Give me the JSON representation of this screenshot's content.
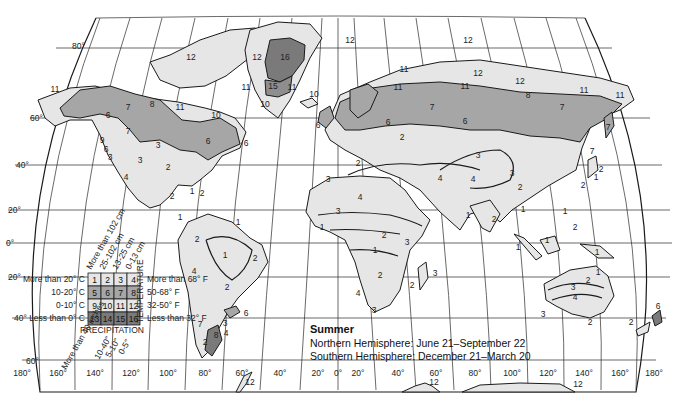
{
  "map": {
    "caption": {
      "title": "Summer",
      "lines": [
        "Northern Hemisphere: June 21–September 22",
        "Southern Hemisphere: December 21–March 20"
      ]
    },
    "latitude_labels": [
      "80°",
      "60°",
      "40°",
      "20°",
      "0°",
      "20°",
      "40°",
      "60°"
    ],
    "longitude_labels": [
      "180°",
      "160°",
      "140°",
      "120°",
      "100°",
      "80°",
      "60°",
      "40°",
      "20°",
      "0°",
      "20°",
      "40°",
      "60°",
      "80°",
      "100°",
      "120°",
      "140°",
      "160°",
      "180°"
    ],
    "colors": {
      "zone_light": "#e6e6e6",
      "zone_medium": "#a6a6a6",
      "zone_dark": "#7a7a7a",
      "ocean": "#ffffff",
      "line": "#1a1a1a"
    },
    "legend": {
      "precipitation_title": "PRECIPITATION",
      "temperature_title": "TEMPERATURE",
      "precip_cm_headers": [
        "More than 102 cm",
        "25-102 cm",
        "13-25 cm",
        "0-13 cm"
      ],
      "precip_in_headers": [
        "More than 40 inches",
        "10-40\"",
        "5-10\"",
        "0-5\""
      ],
      "temp_c_rows": [
        "More than 20° C",
        "10-20° C",
        "0-10° C",
        "Less than 0° C"
      ],
      "temp_f_rows": [
        "More than 68° F",
        "50-68° F",
        "32-50° F",
        "Less than 32° F"
      ],
      "cells": [
        [
          "1",
          "2",
          "3",
          "4"
        ],
        [
          "5",
          "6",
          "7",
          "8"
        ],
        [
          "9",
          "10",
          "11",
          "12"
        ],
        [
          "13",
          "14",
          "15",
          "16"
        ]
      ]
    },
    "zone_labels": [
      {
        "region": "alaska",
        "value": "11"
      },
      {
        "region": "alaska-yukon",
        "value": "6"
      },
      {
        "region": "canada-north",
        "value": "7"
      },
      {
        "region": "canada-northeast",
        "value": "8"
      },
      {
        "region": "canada-arctic",
        "value": "11"
      },
      {
        "region": "canada-arctic-islands",
        "value": "12"
      },
      {
        "region": "hudson",
        "value": "10"
      },
      {
        "region": "canada-east",
        "value": "6"
      },
      {
        "region": "newfoundland",
        "value": "6"
      },
      {
        "region": "bc-coast",
        "value": "7"
      },
      {
        "region": "pacific-nw",
        "value": "9"
      },
      {
        "region": "pacific-coast",
        "value": "6"
      },
      {
        "region": "california",
        "value": "3"
      },
      {
        "region": "great-basin",
        "value": "3"
      },
      {
        "region": "mojave",
        "value": "4"
      },
      {
        "region": "great-plains",
        "value": "3"
      },
      {
        "region": "usa-east",
        "value": "2"
      },
      {
        "region": "florida",
        "value": "1"
      },
      {
        "region": "caribbean",
        "value": "2"
      },
      {
        "region": "mexico",
        "value": "2"
      },
      {
        "region": "central-america",
        "value": "1"
      },
      {
        "region": "greenland-ice",
        "value": "16"
      },
      {
        "region": "greenland-west",
        "value": "12"
      },
      {
        "region": "greenland-center",
        "value": "15"
      },
      {
        "region": "greenland-east",
        "value": "11"
      },
      {
        "region": "greenland-south",
        "value": "10"
      },
      {
        "region": "greenland-sw",
        "value": "11"
      },
      {
        "region": "iceland",
        "value": "10"
      },
      {
        "region": "british-isles",
        "value": "6"
      },
      {
        "region": "svalbard",
        "value": "12"
      },
      {
        "region": "franz-josef",
        "value": "12"
      },
      {
        "region": "novaya-zemlya",
        "value": "11"
      },
      {
        "region": "kola",
        "value": "11"
      },
      {
        "region": "yamal",
        "value": "11"
      },
      {
        "region": "taymyr",
        "value": "12"
      },
      {
        "region": "siberia-north",
        "value": "12"
      },
      {
        "region": "siberia-ne",
        "value": "11"
      },
      {
        "region": "chukotka",
        "value": "11"
      },
      {
        "region": "scandinavia",
        "value": "6"
      },
      {
        "region": "russia-west",
        "value": "7"
      },
      {
        "region": "siberia-central",
        "value": "6"
      },
      {
        "region": "siberia-belt",
        "value": "8"
      },
      {
        "region": "siberia-east",
        "value": "7"
      },
      {
        "region": "kamchatka",
        "value": "7"
      },
      {
        "region": "sakhalin",
        "value": "7"
      },
      {
        "region": "europe",
        "value": "2"
      },
      {
        "region": "iberia",
        "value": "3"
      },
      {
        "region": "mediterranean",
        "value": "2"
      },
      {
        "region": "central-asia",
        "value": "3"
      },
      {
        "region": "tibet",
        "value": "4"
      },
      {
        "region": "tibet-rim",
        "value": "3"
      },
      {
        "region": "china",
        "value": "2"
      },
      {
        "region": "japan-a",
        "value": "2"
      },
      {
        "region": "japan-b",
        "value": "1"
      },
      {
        "region": "japan-c",
        "value": "2"
      },
      {
        "region": "middle-east",
        "value": "4"
      },
      {
        "region": "sahara",
        "value": "4"
      },
      {
        "region": "sahel",
        "value": "3"
      },
      {
        "region": "west-africa",
        "value": "1"
      },
      {
        "region": "central-africa-n",
        "value": "2"
      },
      {
        "region": "east-africa",
        "value": "3"
      },
      {
        "region": "congo",
        "value": "1"
      },
      {
        "region": "southern-africa",
        "value": "2"
      },
      {
        "region": "namib",
        "value": "4"
      },
      {
        "region": "cape",
        "value": "3"
      },
      {
        "region": "madagascar-e",
        "value": "3"
      },
      {
        "region": "madagascar-w",
        "value": "2"
      },
      {
        "region": "india-w",
        "value": "1"
      },
      {
        "region": "india-s",
        "value": "2"
      },
      {
        "region": "southeast-asia",
        "value": "1"
      },
      {
        "region": "philippines",
        "value": "1"
      },
      {
        "region": "philippines-s",
        "value": "2"
      },
      {
        "region": "sumatra",
        "value": "1"
      },
      {
        "region": "borneo",
        "value": "1"
      },
      {
        "region": "new-guinea",
        "value": "1"
      },
      {
        "region": "australia-ne",
        "value": "1"
      },
      {
        "region": "australia-e",
        "value": "2"
      },
      {
        "region": "australia-mid",
        "value": "3"
      },
      {
        "region": "australia-center",
        "value": "4"
      },
      {
        "region": "australia-sw",
        "value": "3"
      },
      {
        "region": "tasmania",
        "value": "2"
      },
      {
        "region": "nz-south",
        "value": "2"
      },
      {
        "region": "nz-north",
        "value": "6"
      },
      {
        "region": "amazon-n",
        "value": "1"
      },
      {
        "region": "amazon",
        "value": "1"
      },
      {
        "region": "nw-south-america",
        "value": "2"
      },
      {
        "region": "ne-brazil",
        "value": "2"
      },
      {
        "region": "brazil-south",
        "value": "2"
      },
      {
        "region": "atacama",
        "value": "4"
      },
      {
        "region": "uruguay",
        "value": "6"
      },
      {
        "region": "chile-south",
        "value": "7"
      },
      {
        "region": "patagonia",
        "value": "8"
      },
      {
        "region": "patagonia-e",
        "value": "3"
      },
      {
        "region": "patagonia-coast",
        "value": "4"
      },
      {
        "region": "tierra-del-fuego",
        "value": "2"
      },
      {
        "region": "antarctic-peninsula",
        "value": "12"
      },
      {
        "region": "antarctica-a",
        "value": "12"
      },
      {
        "region": "antarctica-b",
        "value": "12"
      }
    ]
  }
}
